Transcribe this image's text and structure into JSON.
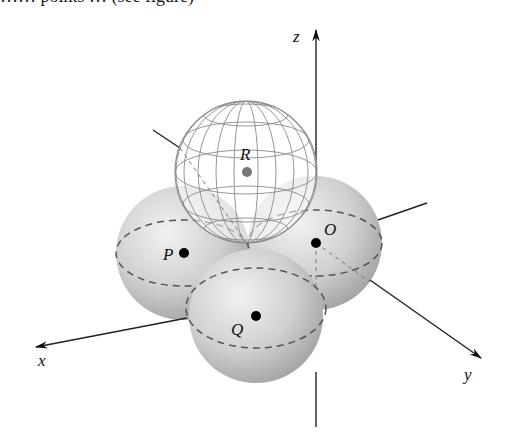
{
  "figure": {
    "top_clipped_text": "…… points … (see figure)",
    "axes": {
      "x_label": "x",
      "y_label": "y",
      "z_label": "z"
    },
    "spheres": [
      {
        "name": "sphere-P",
        "label": "P",
        "style": "shaded",
        "dot_color": "#000000"
      },
      {
        "name": "sphere-O",
        "label": "O",
        "style": "shaded",
        "dot_color": "#000000"
      },
      {
        "name": "sphere-Q",
        "label": "Q",
        "style": "shaded",
        "dot_color": "#000000"
      },
      {
        "name": "sphere-R",
        "label": "R",
        "style": "wireframe",
        "dot_color": "#777777"
      }
    ],
    "colors": {
      "sphere_fill_light": "#eeeeee",
      "sphere_fill_dark": "#9a9a9a",
      "wireframe": "#8a8a8a",
      "dashed": "#555555",
      "axis": "#222222"
    }
  }
}
